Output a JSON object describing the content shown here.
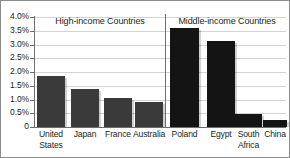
{
  "chart_data": {
    "type": "bar",
    "title": "",
    "xlabel": "",
    "ylabel": "",
    "ylim": [
      0,
      4.0
    ],
    "y_unit": "%",
    "grid": true,
    "legend": "none",
    "panels": [
      {
        "name": "High-income Countries",
        "bar_color": "#3a3a3a",
        "categories": [
          "United States",
          "Japan",
          "France",
          "Australia"
        ],
        "category_lines": [
          [
            "United",
            "States"
          ],
          [
            "Japan"
          ],
          [
            "France"
          ],
          [
            "Australia"
          ]
        ],
        "values": [
          1.87,
          1.4,
          1.05,
          0.92
        ]
      },
      {
        "name": "Middle-income Countries",
        "bar_color": "#141414",
        "categories": [
          "Poland",
          "Egypt",
          "South Africa",
          "China"
        ],
        "category_lines": [
          [
            "Poland"
          ],
          [
            "Egypt"
          ],
          [
            "South",
            "Africa"
          ],
          [
            "China"
          ]
        ],
        "values": [
          3.6,
          3.12,
          0.48,
          0.25
        ]
      }
    ],
    "y_ticks": [
      {
        "value": 4.0,
        "label": "4.0%"
      },
      {
        "value": 3.5,
        "label": "3.5%"
      },
      {
        "value": 3.0,
        "label": "3.0%"
      },
      {
        "value": 2.5,
        "label": "2.5%"
      },
      {
        "value": 2.0,
        "label": "2.0%"
      },
      {
        "value": 1.5,
        "label": "1.5%"
      },
      {
        "value": 1.0,
        "label": "1.0%"
      },
      {
        "value": 0.5,
        "label": "0.5%"
      },
      {
        "value": 0.0,
        "label": "0"
      }
    ]
  },
  "style": {
    "background": "#ffffff",
    "axis_color": "#707070",
    "grid_color": "#d3d3d3",
    "text_color": "#231f20",
    "divider_color": "#6e6e6e"
  }
}
